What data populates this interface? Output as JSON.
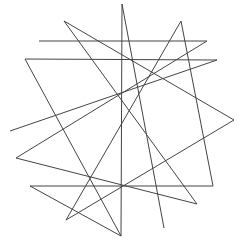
{
  "figure": {
    "width": 241,
    "height": 242,
    "stroke_color": "#444444",
    "background": "#ffffff",
    "segments": [
      [
        122,
        4,
        121,
        236
      ],
      [
        122,
        4,
        164,
        228
      ],
      [
        64,
        21,
        197,
        204
      ],
      [
        64,
        21,
        234,
        120
      ],
      [
        39,
        41,
        207,
        41
      ],
      [
        25,
        59,
        217,
        60
      ],
      [
        25,
        59,
        121,
        236
      ],
      [
        10,
        131,
        217,
        60
      ],
      [
        16,
        158,
        207,
        41
      ],
      [
        16,
        158,
        197,
        204
      ],
      [
        30,
        186,
        213,
        186
      ],
      [
        30,
        186,
        121,
        236
      ],
      [
        181,
        21,
        213,
        186
      ],
      [
        181,
        21,
        66,
        220
      ],
      [
        66,
        220,
        234,
        120
      ]
    ]
  }
}
